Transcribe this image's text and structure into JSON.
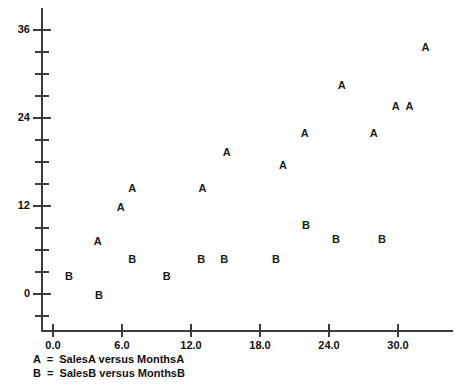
{
  "chart_data": {
    "type": "scatter",
    "title": "",
    "xlabel": "",
    "ylabel": "",
    "xlim": [
      -1.2,
      34.5
    ],
    "ylim": [
      -3.5,
      38
    ],
    "grid": false,
    "legend_position": "below-axis",
    "x_ticks": [
      0.0,
      6.0,
      12.0,
      18.0,
      24.0,
      30.0
    ],
    "x_tick_labels": [
      "0.0",
      "6.0",
      "12.0",
      "18.0",
      "24.0",
      "30.0"
    ],
    "y_ticks": [
      0,
      12,
      24,
      36
    ],
    "y_tick_labels": [
      "0",
      "12",
      "24",
      "36"
    ],
    "y_minor_ticks": [
      -3,
      3,
      6,
      9,
      15,
      18,
      21,
      27,
      30,
      33
    ],
    "series": [
      {
        "name": "SalesA versus MonthsA",
        "marker": "A",
        "points": [
          {
            "x": 3.9,
            "y": 7.2
          },
          {
            "x": 5.9,
            "y": 11.9
          },
          {
            "x": 6.9,
            "y": 14.5
          },
          {
            "x": 13.0,
            "y": 14.5
          },
          {
            "x": 15.1,
            "y": 19.3
          },
          {
            "x": 20.0,
            "y": 17.6
          },
          {
            "x": 21.9,
            "y": 22.0
          },
          {
            "x": 25.1,
            "y": 28.5
          },
          {
            "x": 27.9,
            "y": 22.0
          },
          {
            "x": 29.8,
            "y": 25.6
          },
          {
            "x": 31.0,
            "y": 25.6
          },
          {
            "x": 32.4,
            "y": 33.7
          }
        ]
      },
      {
        "name": "SalesB versus MonthsB",
        "marker": "B",
        "points": [
          {
            "x": 1.4,
            "y": 2.5
          },
          {
            "x": 4.0,
            "y": -0.2
          },
          {
            "x": 6.9,
            "y": 4.8
          },
          {
            "x": 9.9,
            "y": 2.5
          },
          {
            "x": 12.9,
            "y": 4.8
          },
          {
            "x": 14.9,
            "y": 4.8
          },
          {
            "x": 19.4,
            "y": 4.8
          },
          {
            "x": 22.0,
            "y": 9.4
          },
          {
            "x": 24.6,
            "y": 7.5
          },
          {
            "x": 28.6,
            "y": 7.5
          }
        ]
      }
    ]
  },
  "legend": {
    "lines": [
      "A  =  SalesA versus MonthsA",
      "B  =  SalesB versus MonthsB"
    ]
  }
}
